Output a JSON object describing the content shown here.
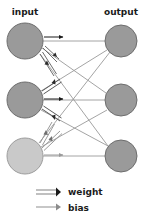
{
  "figure": {
    "type": "neural-network-diagram",
    "width": 148,
    "height": 223,
    "background": "#ffffff"
  },
  "labels": {
    "input": "input",
    "output": "output"
  },
  "legend": {
    "items": [
      {
        "key": "weight",
        "label": "weight",
        "glyph": "double-line-arrow",
        "color": "#3a3a3a"
      },
      {
        "key": "bias",
        "label": "bias",
        "glyph": "single-line-arrow",
        "color": "#8c8c8c"
      }
    ]
  },
  "colors": {
    "node_fill": "#9a9a9a",
    "node_fill_light": "#c9c9c9",
    "node_stroke": "#6e6e6e",
    "connection": "#9a9a9a",
    "weight_arrow_dark": "#262626",
    "weight_arrow_mid": "#8c8c8c",
    "bias_arrow_dark": "#1a1a1a",
    "bias_arrow_light": "#9a9a9a",
    "text": "#1b1b1b"
  },
  "nodes": {
    "input": [
      {
        "id": "i1",
        "cx": 25,
        "cy": 41,
        "r": 18,
        "fill": "#9a9a9a"
      },
      {
        "id": "i2",
        "cx": 25,
        "cy": 100,
        "r": 18,
        "fill": "#9a9a9a"
      },
      {
        "id": "i3",
        "cx": 25,
        "cy": 156,
        "r": 18,
        "fill": "#c9c9c9"
      }
    ],
    "output": [
      {
        "id": "o1",
        "cx": 121,
        "cy": 41,
        "r": 16,
        "fill": "#9a9a9a"
      },
      {
        "id": "o2",
        "cx": 121,
        "cy": 100,
        "r": 16,
        "fill": "#9a9a9a"
      },
      {
        "id": "o3",
        "cx": 121,
        "cy": 156,
        "r": 16,
        "fill": "#9a9a9a"
      }
    ]
  },
  "connections": [
    {
      "from": "i1",
      "to": "o1"
    },
    {
      "from": "i1",
      "to": "o2"
    },
    {
      "from": "i1",
      "to": "o3"
    },
    {
      "from": "i2",
      "to": "o1"
    },
    {
      "from": "i2",
      "to": "o2"
    },
    {
      "from": "i2",
      "to": "o3"
    },
    {
      "from": "i3",
      "to": "o1"
    },
    {
      "from": "i3",
      "to": "o2"
    },
    {
      "from": "i3",
      "to": "o3"
    }
  ],
  "annotations": {
    "bias_arrows": [
      {
        "node": "i1",
        "x1": 46,
        "y1": 37,
        "x2": 66,
        "y2": 37,
        "color": "#1a1a1a"
      },
      {
        "node": "i2",
        "x1": 46,
        "y1": 99,
        "x2": 66,
        "y2": 99,
        "color": "#1a1a1a"
      },
      {
        "node": "i3",
        "x1": 46,
        "y1": 155,
        "x2": 66,
        "y2": 155,
        "color": "#9a9a9a"
      }
    ],
    "weight_arrow_groups": [
      {
        "node": "i1",
        "count": 2,
        "direction": "into-node",
        "color": "#3a3a3a"
      },
      {
        "node": "i2",
        "count": 2,
        "direction": "into-node",
        "color": "#3a3a3a"
      },
      {
        "node": "i3",
        "count": 2,
        "direction": "into-node",
        "color": "#8c8c8c"
      }
    ]
  }
}
